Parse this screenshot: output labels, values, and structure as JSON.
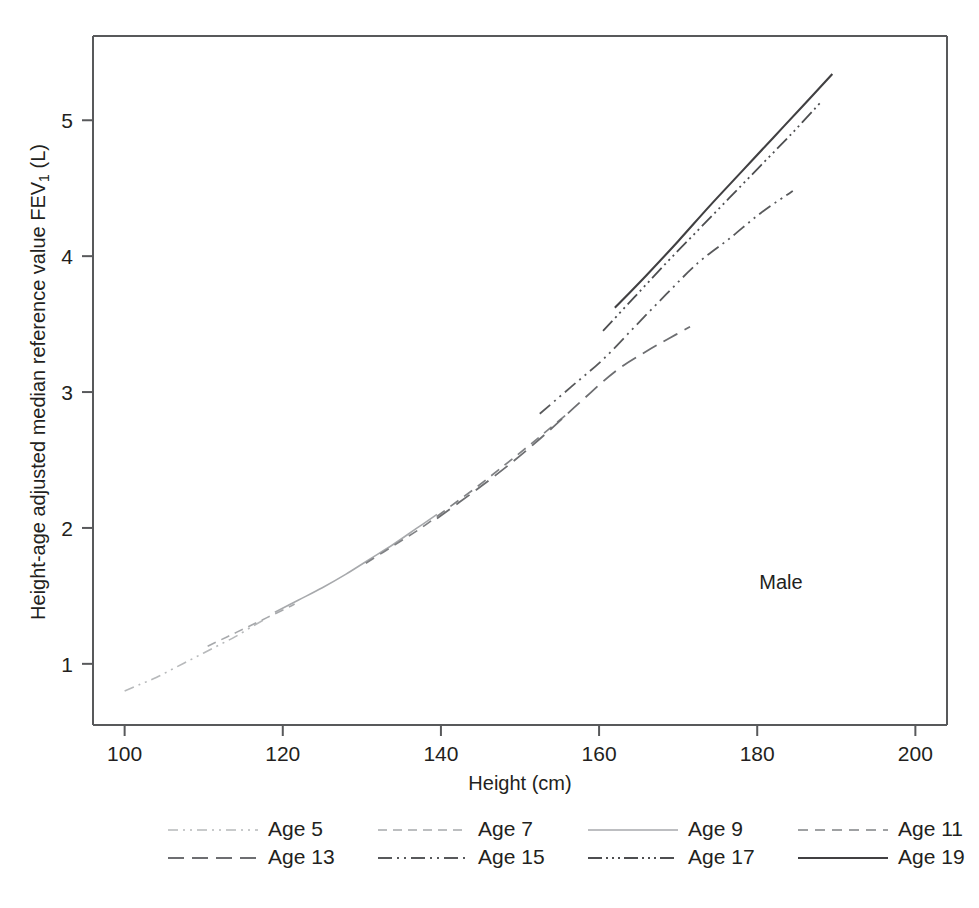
{
  "chart_data": {
    "type": "line",
    "title": "",
    "subtitle": "",
    "xlabel": "Height (cm)",
    "ylabel_parts": {
      "pre": "Height-age adjusted median reference value FEV",
      "sub": "1",
      "post": " (L)"
    },
    "ylabel": "Height-age adjusted median reference value FEV1 (L)",
    "xlim": [
      96,
      204
    ],
    "ylim": [
      0.55,
      5.62
    ],
    "xticks": [
      100,
      120,
      140,
      160,
      180,
      200
    ],
    "yticks": [
      1,
      2,
      3,
      4,
      5
    ],
    "grid": false,
    "legend_position": "below-plot",
    "annotations": [
      {
        "text": "Male",
        "x": 183,
        "y": 1.55
      }
    ],
    "series": [
      {
        "name": "Age 5",
        "legend_label": "Age 5",
        "dash": "10,5,2,5,2,5",
        "width": 1.6,
        "color": "#b7b9bb",
        "points": [
          [
            100.0,
            0.8
          ],
          [
            102.0,
            0.85
          ],
          [
            104.0,
            0.9
          ],
          [
            106.0,
            0.96
          ],
          [
            108.0,
            1.02
          ],
          [
            110.0,
            1.08
          ],
          [
            112.0,
            1.14
          ],
          [
            114.0,
            1.2
          ],
          [
            116.0,
            1.27
          ],
          [
            117.5,
            1.32
          ]
        ]
      },
      {
        "name": "Age 7",
        "legend_label": "Age 7",
        "dash": "9,6",
        "width": 1.6,
        "color": "#a7a9ac",
        "points": [
          [
            110.5,
            1.13
          ],
          [
            113.0,
            1.2
          ],
          [
            115.5,
            1.27
          ],
          [
            118.0,
            1.34
          ],
          [
            120.5,
            1.41
          ],
          [
            121.5,
            1.44
          ]
        ]
      },
      {
        "name": "Age 9",
        "legend_label": "Age 9",
        "dash": "none",
        "width": 1.6,
        "color": "#a7a9ac",
        "points": [
          [
            119.0,
            1.38
          ],
          [
            122.0,
            1.47
          ],
          [
            125.0,
            1.56
          ],
          [
            128.0,
            1.66
          ],
          [
            131.0,
            1.77
          ],
          [
            134.0,
            1.88
          ],
          [
            137.0,
            2.0
          ],
          [
            139.5,
            2.1
          ]
        ]
      },
      {
        "name": "Age 11",
        "legend_label": "Age 11",
        "dash": "10,7",
        "width": 1.7,
        "color": "#808285",
        "points": [
          [
            130.5,
            1.74
          ],
          [
            134.0,
            1.87
          ],
          [
            137.5,
            2.0
          ],
          [
            141.0,
            2.15
          ],
          [
            144.5,
            2.3
          ],
          [
            148.0,
            2.46
          ],
          [
            151.0,
            2.6
          ],
          [
            153.5,
            2.72
          ],
          [
            156.0,
            2.84
          ]
        ]
      },
      {
        "name": "Age 13",
        "legend_label": "Age 13",
        "dash": "16,8",
        "width": 1.8,
        "color": "#6d6e71",
        "points": [
          [
            139.5,
            2.07
          ],
          [
            144.0,
            2.26
          ],
          [
            148.5,
            2.46
          ],
          [
            153.0,
            2.68
          ],
          [
            157.5,
            2.92
          ],
          [
            162.0,
            3.15
          ],
          [
            166.0,
            3.3
          ],
          [
            169.0,
            3.4
          ],
          [
            171.5,
            3.48
          ]
        ]
      },
      {
        "name": "Age 15",
        "legend_label": "Age 15",
        "dash": "14,5,2,5,2,5",
        "width": 1.8,
        "color": "#58595b",
        "points": [
          [
            152.5,
            2.84
          ],
          [
            156.5,
            3.04
          ],
          [
            160.5,
            3.24
          ],
          [
            164.5,
            3.48
          ],
          [
            168.5,
            3.72
          ],
          [
            172.5,
            3.95
          ],
          [
            176.5,
            4.13
          ],
          [
            180.5,
            4.32
          ],
          [
            184.5,
            4.48
          ]
        ]
      },
      {
        "name": "Age 17",
        "legend_label": "Age 17",
        "dash": "14,4,2,4,2,4,2,4",
        "width": 1.8,
        "color": "#4d4e50",
        "points": [
          [
            160.5,
            3.45
          ],
          [
            164.5,
            3.7
          ],
          [
            168.5,
            3.95
          ],
          [
            172.5,
            4.19
          ],
          [
            176.5,
            4.43
          ],
          [
            180.5,
            4.67
          ],
          [
            184.5,
            4.91
          ],
          [
            188.0,
            5.13
          ]
        ]
      },
      {
        "name": "Age 19",
        "legend_label": "Age 19",
        "dash": "none",
        "width": 2.1,
        "color": "#414042",
        "points": [
          [
            162.0,
            3.62
          ],
          [
            166.0,
            3.86
          ],
          [
            170.0,
            4.11
          ],
          [
            174.0,
            4.37
          ],
          [
            178.0,
            4.62
          ],
          [
            182.0,
            4.87
          ],
          [
            186.0,
            5.12
          ],
          [
            189.5,
            5.34
          ]
        ]
      }
    ]
  },
  "figure": {
    "annotation_male": "Male"
  }
}
